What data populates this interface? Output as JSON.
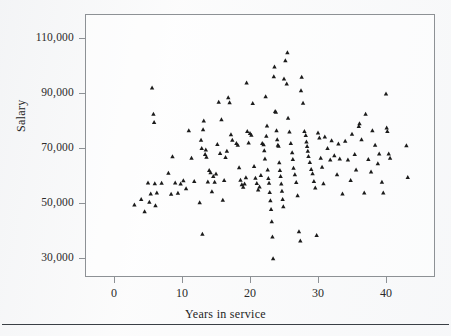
{
  "figure": {
    "kind": "scatter-plot",
    "background_color": "#fbfbfb",
    "frame_color": "#8d9195",
    "marker_color": "#1b1b1b",
    "marker_shape": "triangle-up"
  },
  "axis": {
    "x_title": "Years in service",
    "y_title": "Salary",
    "x_ticks": [
      "0",
      "10",
      "20",
      "30",
      "40"
    ],
    "y_ticks": [
      "30,000",
      "50,000",
      "70,000",
      "90,000",
      "110,000"
    ]
  },
  "chart_data": {
    "type": "scatter",
    "title": "",
    "xlabel": "Years in service",
    "ylabel": "Salary",
    "xlim": [
      -4,
      48
    ],
    "ylim": [
      22000,
      118000
    ],
    "xticks": [
      0,
      10,
      20,
      30,
      40
    ],
    "yticks": [
      30000,
      50000,
      70000,
      90000,
      110000
    ],
    "grid": false,
    "legend": null,
    "marker": "triangle-up",
    "series": [
      {
        "name": "Faculty",
        "points": [
          [
            3,
            49500
          ],
          [
            4,
            51500
          ],
          [
            4.5,
            47000
          ],
          [
            5,
            57500
          ],
          [
            5.2,
            50500
          ],
          [
            5.4,
            53500
          ],
          [
            5.6,
            92000
          ],
          [
            5.8,
            82500
          ],
          [
            5.9,
            79500
          ],
          [
            6,
            57200
          ],
          [
            6.1,
            49200
          ],
          [
            6.3,
            53800
          ],
          [
            7,
            57400
          ],
          [
            8,
            61000
          ],
          [
            8.4,
            53400
          ],
          [
            8.6,
            67000
          ],
          [
            9,
            57500
          ],
          [
            9.4,
            53700
          ],
          [
            9.8,
            57100
          ],
          [
            10.2,
            58300
          ],
          [
            10.6,
            55400
          ],
          [
            11,
            76500
          ],
          [
            11.4,
            66500
          ],
          [
            11.8,
            58000
          ],
          [
            12.6,
            50300
          ],
          [
            12.8,
            73000
          ],
          [
            12.9,
            70000
          ],
          [
            13,
            38800
          ],
          [
            13.1,
            76800
          ],
          [
            13.2,
            80000
          ],
          [
            13.4,
            67800
          ],
          [
            13.5,
            69500
          ],
          [
            13.6,
            66800
          ],
          [
            13.8,
            57800
          ],
          [
            14,
            62000
          ],
          [
            14.2,
            61200
          ],
          [
            14.4,
            54300
          ],
          [
            14.6,
            59800
          ],
          [
            14.8,
            57700
          ],
          [
            15,
            60700
          ],
          [
            15.2,
            71500
          ],
          [
            15.4,
            86800
          ],
          [
            15.6,
            68200
          ],
          [
            15.8,
            80500
          ],
          [
            16,
            51200
          ],
          [
            16.2,
            58400
          ],
          [
            16.4,
            66700
          ],
          [
            16.6,
            69000
          ],
          [
            16.8,
            88500
          ],
          [
            17,
            86600
          ],
          [
            17.2,
            75000
          ],
          [
            17.4,
            73000
          ],
          [
            18,
            71800
          ],
          [
            18.2,
            71200
          ],
          [
            18.4,
            63000
          ],
          [
            18.6,
            58500
          ],
          [
            18.8,
            56800
          ],
          [
            19,
            55900
          ],
          [
            19.2,
            57100
          ],
          [
            19.4,
            59400
          ],
          [
            19.5,
            93800
          ],
          [
            19.6,
            76200
          ],
          [
            19.8,
            72000
          ],
          [
            20,
            75500
          ],
          [
            20.2,
            74800
          ],
          [
            20.4,
            86400
          ],
          [
            20.6,
            63500
          ],
          [
            20.8,
            59200
          ],
          [
            21,
            57300
          ],
          [
            21.2,
            54900
          ],
          [
            21.4,
            56000
          ],
          [
            21.6,
            60200
          ],
          [
            21.8,
            71800
          ],
          [
            22,
            71400
          ],
          [
            22.1,
            69200
          ],
          [
            22.2,
            66200
          ],
          [
            22.3,
            88800
          ],
          [
            22.4,
            74500
          ],
          [
            22.5,
            78200
          ],
          [
            22.6,
            62200
          ],
          [
            22.7,
            59100
          ],
          [
            22.8,
            57400
          ],
          [
            22.9,
            54000
          ],
          [
            23,
            51000
          ],
          [
            23.1,
            47800
          ],
          [
            23.2,
            43400
          ],
          [
            23.3,
            37800
          ],
          [
            23.4,
            29900
          ],
          [
            23.5,
            96100
          ],
          [
            23.6,
            99600
          ],
          [
            23.7,
            83500
          ],
          [
            23.8,
            83200
          ],
          [
            23.9,
            76500
          ],
          [
            24,
            73200
          ],
          [
            24.1,
            71200
          ],
          [
            24.2,
            70800
          ],
          [
            24.3,
            64800
          ],
          [
            24.4,
            62000
          ],
          [
            24.5,
            59800
          ],
          [
            24.6,
            57100
          ],
          [
            24.7,
            54500
          ],
          [
            24.8,
            51500
          ],
          [
            24.9,
            48800
          ],
          [
            25,
            95300
          ],
          [
            25.2,
            101900
          ],
          [
            25.4,
            93500
          ],
          [
            25.5,
            104800
          ],
          [
            25.6,
            81000
          ],
          [
            25.8,
            76000
          ],
          [
            26,
            71800
          ],
          [
            26.2,
            68500
          ],
          [
            26.3,
            66000
          ],
          [
            26.4,
            62800
          ],
          [
            26.6,
            60500
          ],
          [
            26.8,
            57600
          ],
          [
            27,
            52800
          ],
          [
            27.2,
            39700
          ],
          [
            27.4,
            36400
          ],
          [
            27.5,
            91000
          ],
          [
            27.6,
            95900
          ],
          [
            27.8,
            86500
          ],
          [
            28,
            76200
          ],
          [
            28.2,
            74700
          ],
          [
            28.3,
            72400
          ],
          [
            28.4,
            70700
          ],
          [
            28.5,
            69000
          ],
          [
            28.6,
            67100
          ],
          [
            28.8,
            64900
          ],
          [
            29,
            62400
          ],
          [
            29.2,
            60800
          ],
          [
            29.4,
            58000
          ],
          [
            29.6,
            55600
          ],
          [
            29.8,
            38400
          ],
          [
            30,
            75600
          ],
          [
            30.2,
            73800
          ],
          [
            30.4,
            66500
          ],
          [
            30.6,
            63200
          ],
          [
            30.8,
            57200
          ],
          [
            31,
            74200
          ],
          [
            31.4,
            70000
          ],
          [
            31.8,
            65800
          ],
          [
            32,
            72800
          ],
          [
            32.4,
            67400
          ],
          [
            32.8,
            60500
          ],
          [
            33,
            71600
          ],
          [
            33.2,
            66200
          ],
          [
            33.6,
            53500
          ],
          [
            34,
            72600
          ],
          [
            34.4,
            65800
          ],
          [
            34.8,
            58400
          ],
          [
            35,
            75200
          ],
          [
            35.4,
            67800
          ],
          [
            35.6,
            62200
          ],
          [
            36,
            78000
          ],
          [
            36.1,
            79000
          ],
          [
            36.4,
            73200
          ],
          [
            36.8,
            53800
          ],
          [
            37,
            82500
          ],
          [
            37.4,
            66000
          ],
          [
            37.8,
            61500
          ],
          [
            38,
            76500
          ],
          [
            38.4,
            71200
          ],
          [
            38.8,
            64500
          ],
          [
            39,
            68000
          ],
          [
            39.4,
            57700
          ],
          [
            39.6,
            53800
          ],
          [
            40,
            89800
          ],
          [
            40.1,
            77500
          ],
          [
            40.2,
            76200
          ],
          [
            40.4,
            68000
          ],
          [
            40.6,
            66500
          ],
          [
            43,
            71000
          ],
          [
            43.2,
            59500
          ]
        ]
      }
    ]
  }
}
